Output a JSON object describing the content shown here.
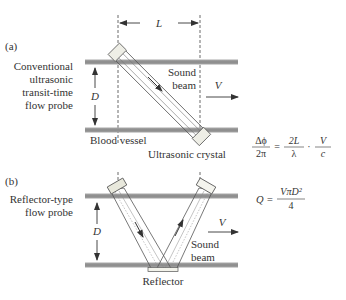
{
  "panel_a": {
    "tag": "(a)",
    "title_lines": [
      "Conventional",
      "ultrasonic",
      "transit-time",
      "flow probe"
    ],
    "dimension_L": "L",
    "dimension_D": "D",
    "velocity": "V",
    "sound_beam_lines": [
      "Sound",
      "beam"
    ],
    "vessel_label": "Blood vessel",
    "crystal_label": "Ultrasonic crystal",
    "equation": {
      "lhs_num": "Δϕ",
      "lhs_den": "2π",
      "eq": "=",
      "mid_num": "2L",
      "mid_den": "λ",
      "dot": "·",
      "rhs_num": "V",
      "rhs_den": "c"
    }
  },
  "panel_b": {
    "tag": "(b)",
    "title_lines": [
      "Reflector-type",
      "flow probe"
    ],
    "dimension_D": "D",
    "velocity": "V",
    "sound_beam_lines": [
      "Sound",
      "beam"
    ],
    "reflector_label": "Reflector",
    "equation": {
      "lhs": "Q =",
      "num": "VπD²",
      "den": "4"
    }
  },
  "colors": {
    "vessel_wall": "#8f8f8f",
    "line": "#333333",
    "crystal_fill": "#e8e8e0"
  }
}
